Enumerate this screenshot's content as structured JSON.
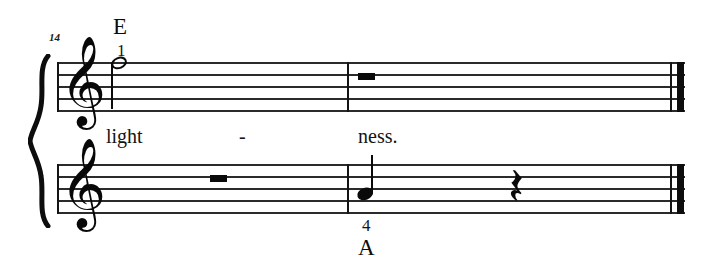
{
  "sheet": {
    "width": 719,
    "height": 272,
    "background": "#ffffff",
    "ink_color": "#141414",
    "measure_number": "14",
    "system": {
      "brace": "curly-brace",
      "staff_count": 2,
      "left_barline": true,
      "final_barline": "thin-thick"
    }
  },
  "staves": [
    {
      "id": "upper",
      "clef": "treble",
      "clef_glyph": "𝄞",
      "measures": [
        {
          "number": "14",
          "elements": [
            {
              "type": "note",
              "duration": "half",
              "notehead": "open",
              "stem": "down",
              "pitch_position": "top-line",
              "fingering": "1",
              "chord_label": "E"
            }
          ]
        },
        {
          "number": "15",
          "elements": [
            {
              "type": "rest",
              "duration": "half",
              "position": "middle-line"
            }
          ]
        }
      ]
    },
    {
      "id": "lower",
      "clef": "treble",
      "clef_glyph": "𝄞",
      "measures": [
        {
          "number": "14",
          "elements": [
            {
              "type": "rest",
              "duration": "half",
              "position": "middle-line"
            }
          ]
        },
        {
          "number": "15",
          "elements": [
            {
              "type": "note",
              "duration": "quarter",
              "notehead": "filled",
              "stem": "up",
              "pitch_position": "second-space",
              "fingering": "4",
              "chord_label": "A"
            },
            {
              "type": "rest",
              "duration": "quarter",
              "glyph": "𝄽"
            }
          ]
        }
      ]
    }
  ],
  "lyrics": [
    {
      "text": "light",
      "syllable_type": "start"
    },
    {
      "text": "-",
      "syllable_type": "extender-hyphen"
    },
    {
      "text": "ness.",
      "syllable_type": "end"
    }
  ],
  "annotations": {
    "chord_above": "E",
    "chord_below": "A",
    "fingering_upper": "1",
    "fingering_lower": "4"
  }
}
